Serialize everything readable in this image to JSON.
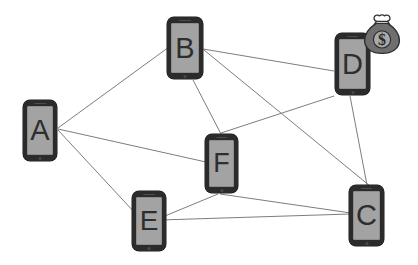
{
  "diagram": {
    "type": "network-graph",
    "title": "",
    "background_color": "#ffffff",
    "edge_color": "#7d7d7d",
    "node_frame_color": "#2b2b2b",
    "node_screen_color": "#a3a3a3",
    "node_label_color": "#2e2e2e",
    "nodes": [
      {
        "id": "A",
        "label": "A",
        "x": 23,
        "y": 100,
        "w": 34,
        "h": 61,
        "font_size": 29
      },
      {
        "id": "B",
        "label": "B",
        "x": 167,
        "y": 17,
        "w": 36,
        "h": 62,
        "font_size": 29
      },
      {
        "id": "D",
        "label": "D",
        "x": 335,
        "y": 33,
        "w": 35,
        "h": 62,
        "font_size": 29
      },
      {
        "id": "F",
        "label": "F",
        "x": 205,
        "y": 134,
        "w": 33,
        "h": 59,
        "font_size": 27
      },
      {
        "id": "E",
        "label": "E",
        "x": 132,
        "y": 191,
        "w": 34,
        "h": 60,
        "font_size": 28
      },
      {
        "id": "C",
        "label": "C",
        "x": 349,
        "y": 185,
        "w": 35,
        "h": 61,
        "font_size": 29
      }
    ],
    "edges": [
      {
        "from": "A",
        "to": "B",
        "x1": 58,
        "y1": 128,
        "x2": 169,
        "y2": 47
      },
      {
        "from": "A",
        "to": "F",
        "x1": 58,
        "y1": 129,
        "x2": 206,
        "y2": 162
      },
      {
        "from": "A",
        "to": "E",
        "x1": 58,
        "y1": 130,
        "x2": 135,
        "y2": 213
      },
      {
        "from": "B",
        "to": "D",
        "x1": 203,
        "y1": 49,
        "x2": 334,
        "y2": 71
      },
      {
        "from": "B",
        "to": "C",
        "x1": 204,
        "y1": 50,
        "x2": 370,
        "y2": 186
      },
      {
        "from": "B",
        "to": "F",
        "x1": 193,
        "y1": 80,
        "x2": 221,
        "y2": 134
      },
      {
        "from": "D",
        "to": "F",
        "x1": 334,
        "y1": 96,
        "x2": 221,
        "y2": 133
      },
      {
        "from": "D",
        "to": "C",
        "x1": 350,
        "y1": 96,
        "x2": 367,
        "y2": 185
      },
      {
        "from": "F",
        "to": "E",
        "x1": 218,
        "y1": 194,
        "x2": 160,
        "y2": 218
      },
      {
        "from": "F",
        "to": "C",
        "x1": 220,
        "y1": 194,
        "x2": 351,
        "y2": 213
      },
      {
        "from": "E",
        "to": "C",
        "x1": 160,
        "y1": 220,
        "x2": 350,
        "y2": 214
      }
    ],
    "icons": [
      {
        "id": "money-bag",
        "name": "money-bag-icon",
        "symbol": "$",
        "x": 361,
        "y": 12,
        "w": 42,
        "h": 44,
        "attached_to": "D"
      }
    ]
  }
}
